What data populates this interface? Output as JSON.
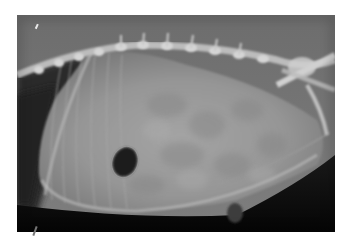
{
  "image": {
    "subject": "lateral abdominal radiograph",
    "alt": "Lateral abdominal X-ray showing enlarged soft-tissue density abdomen, spine along top, and a dark gas pocket in the lower-left mid abdomen",
    "colors": {
      "background": "#ffffff",
      "film_dark": "#0a0a0a",
      "soft_tissue": "#8c8c8c",
      "bone": "#d8d8d8",
      "gas": "#1e1e1e"
    },
    "features": [
      {
        "name": "spine",
        "location": "top edge, left to right"
      },
      {
        "name": "thoracic-region",
        "location": "upper left, dark"
      },
      {
        "name": "abdominal-mass",
        "location": "center, large grey density"
      },
      {
        "name": "gas-pocket",
        "location": "lower left center"
      },
      {
        "name": "pelvis",
        "location": "upper right"
      },
      {
        "name": "ventral-body-wall",
        "location": "bottom curve"
      }
    ]
  }
}
